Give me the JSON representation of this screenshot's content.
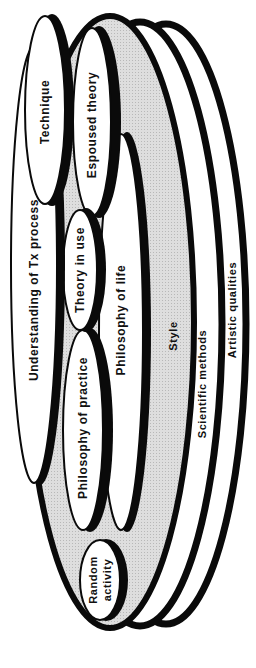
{
  "diagram": {
    "orientation": "rotated-90-ccw",
    "colors": {
      "outline": "#0a0a0a",
      "fill_white": "#ffffff",
      "fill_gray": "#d9d9d9",
      "background": "#ffffff"
    },
    "outer_layers": [
      {
        "id": "artistic",
        "label": "Artistic qualities"
      },
      {
        "id": "scientific",
        "label": "Scientific methods"
      },
      {
        "id": "style",
        "label": "Style"
      }
    ],
    "inner_nodes": [
      {
        "id": "technique",
        "label": "Technique"
      },
      {
        "id": "espoused",
        "label": "Espoused theory"
      },
      {
        "id": "understanding",
        "label": "Understanding of Tx process"
      },
      {
        "id": "theory_in_use",
        "label": "Theory in use"
      },
      {
        "id": "philosophy_practice",
        "label": "Philosophy of practice"
      },
      {
        "id": "philosophy_life",
        "label": "Philosophy of life"
      },
      {
        "id": "random_line1",
        "label": "Random"
      },
      {
        "id": "random_line2",
        "label": "activity"
      }
    ]
  }
}
